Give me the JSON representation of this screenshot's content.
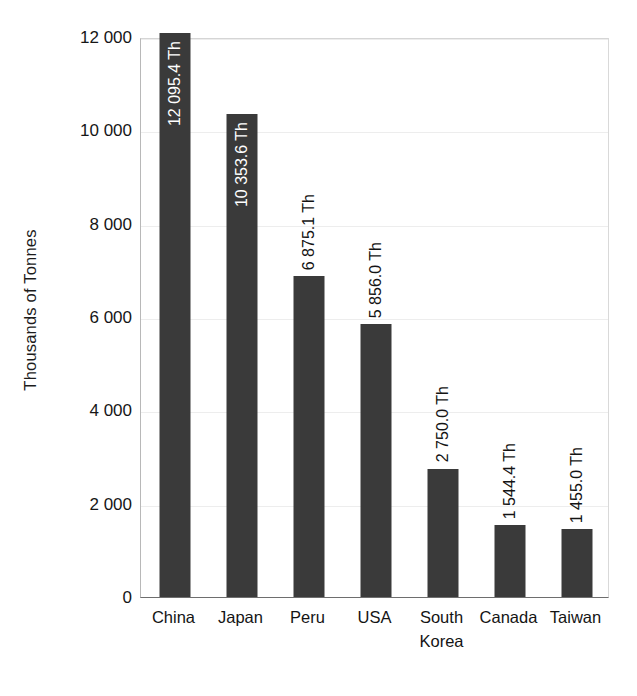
{
  "chart_data": {
    "type": "bar",
    "title": "",
    "subtitle": "",
    "xlabel": "",
    "ylabel": "Thousands of Tonnes",
    "ylim": [
      0,
      12000
    ],
    "ytick_values": [
      0,
      2000,
      4000,
      6000,
      8000,
      10000,
      12000
    ],
    "ytick_labels": [
      "0",
      "2 000",
      "4 000",
      "6 000",
      "8 000",
      "10 000",
      "12 000"
    ],
    "grid": true,
    "grid_axis": "y",
    "legend": false,
    "legend_position": "none",
    "bar_color": "#3a3a3a",
    "categories": [
      "China",
      "Japan",
      "Peru",
      "USA",
      "South Korea",
      "Canada",
      "Taiwan"
    ],
    "category_labels": [
      "China",
      "Japan",
      "Peru",
      "USA",
      "South\nKorea",
      "Canada",
      "Taiwan"
    ],
    "values": [
      12095.4,
      10353.6,
      6875.1,
      5856.0,
      2750.0,
      1544.4,
      1455.0
    ],
    "data_labels": [
      "12 095.4 Th",
      "10 353.6 Th",
      "6 875.1 Th",
      "5 856.0 Th",
      "2 750.0 Th",
      "1 544.4 Th",
      "1 455.0 Th"
    ],
    "data_label_placement": [
      "inside",
      "inside",
      "outside",
      "outside",
      "outside",
      "outside",
      "outside"
    ],
    "data_label_rotation": 90,
    "data_label_unit": "Th"
  }
}
